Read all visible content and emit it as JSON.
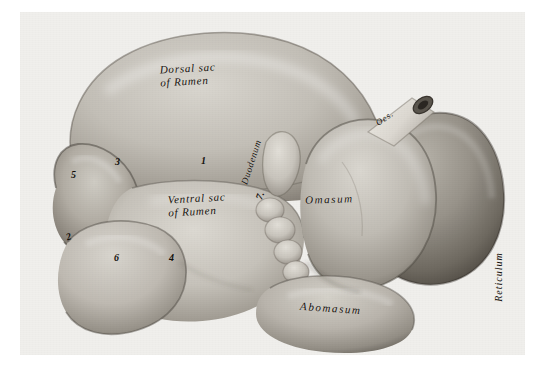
{
  "figure": {
    "kind": "anatomical-photograph",
    "plate_background": "#f0efec",
    "paper_background": "#ffffff",
    "ink_color": "#14100c"
  },
  "labels": {
    "dorsal_sac_line1": "Dorsal sac",
    "dorsal_sac_line2": "of Rumen",
    "ventral_sac_line1": "Ventral sac",
    "ventral_sac_line2": "of Rumen",
    "omasum": "Omasum",
    "abomasum": "Abomasum",
    "duodenum": "Duodenum",
    "reticulum": "Reticulum",
    "oesophagus": "Oes."
  },
  "reference_numbers": {
    "n1": "1",
    "n2": "2",
    "n3": "3",
    "n4": "4",
    "n5": "5",
    "n6": "6",
    "n7": "7."
  }
}
